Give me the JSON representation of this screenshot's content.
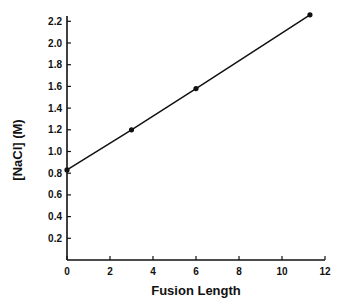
{
  "chart_data": {
    "type": "line",
    "title": "",
    "xlabel": "Fusion Length",
    "ylabel": "[NaCl] (M)",
    "xlim": [
      0,
      12
    ],
    "ylim": [
      0,
      2.2
    ],
    "x_ticks": [
      "0",
      "2",
      "4",
      "6",
      "8",
      "10",
      "12"
    ],
    "y_ticks": [
      "0.2",
      "0.4",
      "0.6",
      "0.8",
      "1.0",
      "1.2",
      "1.4",
      "1.6",
      "1.8",
      "2.0",
      "2.2"
    ],
    "grid": false,
    "legend": null,
    "series": [
      {
        "name": "[NaCl]",
        "x": [
          0,
          3,
          6,
          11.3
        ],
        "y": [
          0.83,
          1.2,
          1.58,
          2.26
        ],
        "marker": "filled-circle",
        "line": "solid"
      }
    ]
  }
}
